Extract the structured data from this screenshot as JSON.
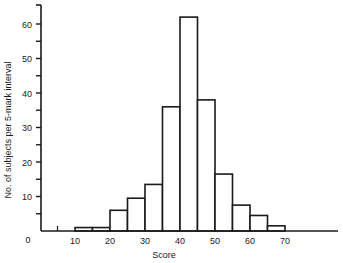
{
  "chart_data": {
    "type": "bar",
    "title": "",
    "xlabel": "Score",
    "ylabel": "No. of subjects per 5-mark interval",
    "bin_width": 5,
    "bins": [
      {
        "from": 10,
        "to": 15,
        "value": 1
      },
      {
        "from": 15,
        "to": 20,
        "value": 1
      },
      {
        "from": 20,
        "to": 25,
        "value": 6
      },
      {
        "from": 25,
        "to": 30,
        "value": 9.5
      },
      {
        "from": 30,
        "to": 35,
        "value": 13.5
      },
      {
        "from": 35,
        "to": 40,
        "value": 36
      },
      {
        "from": 40,
        "to": 45,
        "value": 62
      },
      {
        "from": 45,
        "to": 50,
        "value": 38
      },
      {
        "from": 50,
        "to": 55,
        "value": 16.5
      },
      {
        "from": 55,
        "to": 60,
        "value": 7.5
      },
      {
        "from": 60,
        "to": 65,
        "value": 4.5
      },
      {
        "from": 65,
        "to": 70,
        "value": 1.5
      }
    ],
    "categories": [
      "10-15",
      "15-20",
      "20-25",
      "25-30",
      "30-35",
      "35-40",
      "40-45",
      "45-50",
      "50-55",
      "55-60",
      "60-65",
      "65-70"
    ],
    "values": [
      1,
      1,
      6,
      9.5,
      13.5,
      36,
      62,
      38,
      16.5,
      7.5,
      4.5,
      1.5
    ],
    "x_ticks": [
      "10",
      "20",
      "30",
      "40",
      "50",
      "60",
      "70"
    ],
    "y_ticks": [
      "10",
      "20",
      "30",
      "40",
      "50",
      "60"
    ],
    "origin_label": "0",
    "ylim": [
      0,
      65
    ],
    "xlim": [
      0,
      85
    ],
    "grid": false,
    "legend": null
  }
}
